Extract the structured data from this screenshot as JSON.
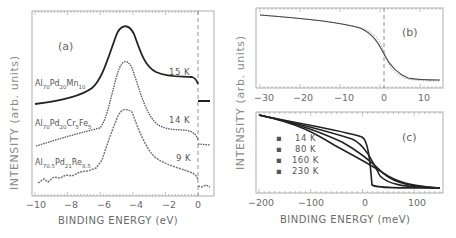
{
  "chart_data": [
    {
      "panel": "(a)",
      "type": "line",
      "xlabel": "BINDING ENERGY (eV)",
      "ylabel": "INTENSITY (arb. units)",
      "xlim": [
        -10,
        1.2
      ],
      "xticks": [
        "-10",
        "-8",
        "-6",
        "-4",
        "-2",
        "0"
      ],
      "annotations": [
        "dashed vertical line at 0"
      ],
      "series": [
        {
          "name": "Al70Pd20Mn10",
          "temperature": "15 K",
          "x": [
            -10,
            -8,
            -6,
            -5,
            -4.5,
            -4.2,
            -3.8,
            -3,
            -2,
            -1,
            -0.5,
            0,
            0.1,
            1.2
          ],
          "y": [
            0.62,
            0.66,
            0.74,
            0.88,
            1.0,
            1.03,
            0.98,
            0.8,
            0.72,
            0.72,
            0.7,
            0.66,
            0.6,
            0.6
          ]
        },
        {
          "name": "Al70Pd20Cr5Fe5",
          "temperature": "14 K",
          "x": [
            -10,
            -8,
            -6,
            -5,
            -4.5,
            -4.2,
            -3.8,
            -3,
            -2,
            -1,
            -0.5,
            0,
            0.1,
            1.2
          ],
          "y": [
            0.34,
            0.4,
            0.48,
            0.64,
            0.8,
            0.84,
            0.8,
            0.58,
            0.48,
            0.49,
            0.47,
            0.43,
            0.37,
            0.37
          ]
        },
        {
          "name": "Al70.5Pd21Re8.5",
          "temperature": "9 K",
          "x": [
            -10,
            -8,
            -6,
            -5,
            -4.5,
            -4.2,
            -3.8,
            -3,
            -2,
            -1,
            -0.5,
            0,
            0.1,
            1.2
          ],
          "y": [
            0.1,
            0.14,
            0.2,
            0.4,
            0.58,
            0.6,
            0.56,
            0.36,
            0.26,
            0.22,
            0.2,
            0.18,
            0.12,
            0.12
          ]
        }
      ],
      "legend": "inline labels left of curves, temperatures on right"
    },
    {
      "panel": "(b)",
      "type": "line",
      "xlabel": "",
      "ylabel": "INTENSITY (arb. units)",
      "xlim": [
        -32,
        14
      ],
      "xticks": [
        "-30",
        "-20",
        "-10",
        "0",
        "10"
      ],
      "annotations": [
        "dashed vertical line at 0",
        "dotted comparison curve"
      ],
      "series": [
        {
          "name": "data (points)",
          "x": [
            -31,
            -20,
            -10,
            -5,
            -2,
            0,
            2,
            5,
            10,
            14
          ],
          "y": [
            0.97,
            0.92,
            0.86,
            0.78,
            0.64,
            0.5,
            0.34,
            0.16,
            0.05,
            0.04
          ]
        },
        {
          "name": "fit (solid)",
          "x": [
            -31,
            -20,
            -10,
            -5,
            -2,
            0,
            2,
            5,
            10,
            14
          ],
          "y": [
            0.97,
            0.92,
            0.86,
            0.78,
            0.64,
            0.5,
            0.34,
            0.16,
            0.05,
            0.04
          ]
        },
        {
          "name": "dotted",
          "x": [
            -31,
            -10,
            -5,
            -2,
            0,
            2,
            5,
            10,
            14
          ],
          "y": [
            0.97,
            0.87,
            0.82,
            0.7,
            0.5,
            0.28,
            0.1,
            0.04,
            0.04
          ]
        }
      ]
    },
    {
      "panel": "(c)",
      "type": "line",
      "xlabel": "BINDING ENERGY (meV)",
      "ylabel": "INTENSITY (arb. units)",
      "xlim": [
        -205,
        150
      ],
      "xticks": [
        "-200",
        "-100",
        "0",
        "100"
      ],
      "legend": [
        "14 K",
        "80 K",
        "160 K",
        "230 K"
      ],
      "legend_position": "left-middle",
      "series": [
        {
          "name": "14 K",
          "x": [
            -200,
            -100,
            -20,
            -5,
            0,
            5,
            20,
            150
          ],
          "y": [
            0.95,
            0.83,
            0.74,
            0.65,
            0.45,
            0.05,
            0.02,
            0.02
          ]
        },
        {
          "name": "80 K",
          "x": [
            -200,
            -100,
            -40,
            -15,
            0,
            15,
            40,
            150
          ],
          "y": [
            0.95,
            0.82,
            0.7,
            0.58,
            0.45,
            0.15,
            0.03,
            0.02
          ]
        },
        {
          "name": "160 K",
          "x": [
            -200,
            -100,
            -60,
            -25,
            0,
            25,
            60,
            150
          ],
          "y": [
            0.95,
            0.8,
            0.66,
            0.56,
            0.45,
            0.25,
            0.05,
            0.02
          ]
        },
        {
          "name": "230 K",
          "x": [
            -200,
            -100,
            -80,
            -35,
            0,
            35,
            80,
            150
          ],
          "y": [
            0.95,
            0.78,
            0.62,
            0.55,
            0.45,
            0.28,
            0.07,
            0.02
          ]
        }
      ]
    }
  ],
  "labels": {
    "a_panel": "(a)",
    "b_panel": "(b)",
    "c_panel": "(c)",
    "a_xlabel": "BINDING ENERGY (eV)",
    "c_xlabel": "BINDING ENERGY (meV)",
    "a_ylabel": "INTENSITY (arb. units)",
    "bc_ylabel": "INTENSITY (arb. units)",
    "a_xticks": [
      "−10",
      "−8",
      "−6",
      "−4",
      "−2",
      "0"
    ],
    "b_xticks": [
      "−30",
      "−20",
      "−10",
      "0",
      "10"
    ],
    "c_xticks": [
      "−200",
      "−100",
      "0",
      "100"
    ],
    "samples": {
      "s1": {
        "el1": "Al",
        "n1": "70",
        "el2": "Pd",
        "n2": "20",
        "el3": "Mn",
        "n3": "10"
      },
      "s2": {
        "el1": "Al",
        "n1": "70",
        "el2": "Pd",
        "n2": "20",
        "el3": "Cr",
        "n3": "5",
        "el4": "Fe",
        "n4": "5"
      },
      "s3": {
        "el1": "Al",
        "n1": "70.5",
        "el2": "Pd",
        "n2": "21",
        "el3": "Re",
        "n3": "8.5"
      }
    },
    "temps": [
      "15 K",
      "14 K",
      "9 K"
    ],
    "legend": [
      "14 K",
      "80 K",
      "160 K",
      "230 K"
    ]
  }
}
